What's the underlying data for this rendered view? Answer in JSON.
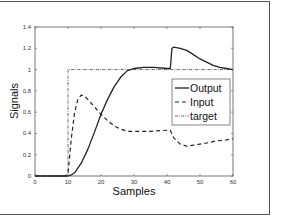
{
  "chart_data": {
    "type": "line",
    "title": "",
    "xlabel": "Samples",
    "ylabel": "Signals",
    "xlim": [
      0,
      60
    ],
    "ylim": [
      0,
      1.4
    ],
    "xticks": [
      "0",
      "10",
      "20",
      "30",
      "40",
      "50",
      "60"
    ],
    "yticks": [
      "0",
      "0.2",
      "0.4",
      "0.6",
      "0.8",
      "1",
      "1.2",
      "1.4"
    ],
    "grid": false,
    "legend_position": "inside-right",
    "legend": [
      "Output",
      "Input",
      "target"
    ],
    "series": [
      {
        "name": "Output",
        "style": "solid",
        "x": [
          0,
          10,
          11,
          12,
          14,
          16,
          18,
          20,
          22,
          24,
          26,
          28,
          30,
          33,
          36,
          40,
          41,
          41.5,
          42,
          44,
          46,
          48,
          50,
          52,
          54,
          56,
          58,
          60
        ],
        "y": [
          0,
          0,
          0.01,
          0.03,
          0.12,
          0.25,
          0.41,
          0.58,
          0.72,
          0.84,
          0.93,
          0.99,
          1.01,
          1.02,
          1.02,
          1.01,
          1.01,
          1.2,
          1.21,
          1.2,
          1.18,
          1.14,
          1.1,
          1.07,
          1.04,
          1.02,
          1.01,
          1.0
        ]
      },
      {
        "name": "Input",
        "style": "dashed",
        "x": [
          0,
          9,
          10,
          11,
          12,
          13,
          14,
          15,
          16,
          18,
          20,
          22,
          24,
          26,
          28,
          30,
          35,
          40,
          41,
          42,
          44,
          46,
          48,
          50,
          52,
          55,
          58,
          60
        ],
        "y": [
          0,
          0,
          0.02,
          0.35,
          0.6,
          0.72,
          0.76,
          0.75,
          0.72,
          0.65,
          0.58,
          0.52,
          0.47,
          0.44,
          0.42,
          0.42,
          0.42,
          0.43,
          0.43,
          0.36,
          0.3,
          0.28,
          0.29,
          0.3,
          0.31,
          0.33,
          0.34,
          0.35
        ]
      },
      {
        "name": "target",
        "style": "dashdot",
        "x": [
          0,
          10,
          10,
          60
        ],
        "y": [
          0,
          0,
          1,
          1
        ]
      }
    ]
  }
}
